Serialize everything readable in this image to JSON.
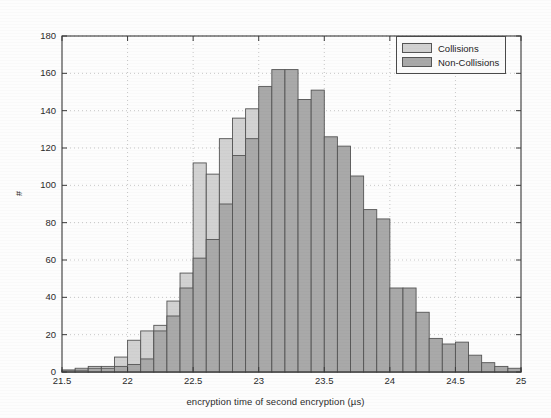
{
  "chart_data": {
    "type": "bar",
    "title": "",
    "subtitle": "",
    "xlabel": "encryption time of second encryption (µs)",
    "ylabel": "#",
    "xlim": [
      21.5,
      25.0
    ],
    "ylim": [
      0,
      180
    ],
    "xticks": [
      21.5,
      22,
      22.5,
      23,
      23.5,
      24,
      24.5,
      25
    ],
    "xtick_labels": [
      "21.5",
      "22",
      "22.5",
      "23",
      "23.5",
      "24",
      "24.5",
      "25"
    ],
    "yticks": [
      0,
      20,
      40,
      60,
      80,
      100,
      120,
      140,
      160,
      180
    ],
    "ytick_labels": [
      "0",
      "20",
      "40",
      "60",
      "80",
      "100",
      "120",
      "140",
      "160",
      "180"
    ],
    "grid": true,
    "grid_style": "dotted",
    "bin_width": 0.1,
    "legend_position": "top-right",
    "legend": [
      {
        "name": "Collisions",
        "color": "#d2d2d2"
      },
      {
        "name": "Non-Collisions",
        "color": "#a9a9a9"
      }
    ],
    "bin_starts": [
      21.5,
      21.6,
      21.7,
      21.8,
      21.9,
      22.0,
      22.1,
      22.2,
      22.3,
      22.4,
      22.5,
      22.6,
      22.7,
      22.8,
      22.9,
      23.0,
      23.1,
      23.2,
      23.3,
      23.4,
      23.5,
      23.6,
      23.7,
      23.8,
      23.9,
      24.0,
      24.1,
      24.2,
      24.3,
      24.4,
      24.5,
      24.6,
      24.7,
      24.8,
      24.9
    ],
    "series": [
      {
        "name": "Collisions",
        "color": "#d2d2d2",
        "edge_color": "#555555",
        "values": [
          1,
          2,
          3,
          3,
          8,
          17,
          22,
          25,
          38,
          53,
          112,
          106,
          125,
          136,
          141,
          126,
          100,
          74,
          50,
          36,
          26,
          18,
          13,
          9,
          7,
          5,
          4,
          3,
          2,
          2,
          1,
          1,
          1,
          1,
          1
        ]
      },
      {
        "name": "Non-Collisions",
        "color": "#a9a9a9",
        "edge_color": "#555555",
        "values": [
          1,
          1,
          2,
          2,
          3,
          4,
          7,
          22,
          30,
          45,
          61,
          71,
          90,
          116,
          125,
          153,
          162,
          162,
          146,
          151,
          126,
          121,
          105,
          87,
          82,
          45,
          45,
          32,
          18,
          15,
          16,
          9,
          5,
          3,
          2
        ]
      }
    ]
  },
  "figure": {
    "plot_left_px": 62,
    "plot_right_px": 521,
    "plot_top_px": 36,
    "plot_bottom_px": 372
  }
}
